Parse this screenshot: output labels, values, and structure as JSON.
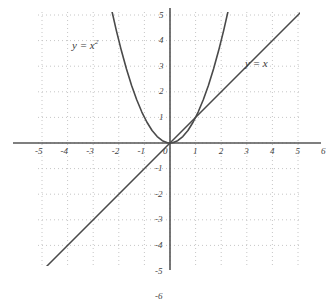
{
  "chart_data": {
    "type": "line",
    "title": "",
    "xlabel": "",
    "ylabel": "",
    "xlim": [
      -5.6,
      6.3
    ],
    "ylim": [
      -6.35,
      6.35
    ],
    "grid": true,
    "grid_style": "dotted",
    "grid_spacing": 1,
    "legend_position": "inline-annotations",
    "axes": {
      "x_axis_label_values": [
        "-5",
        "-4",
        "-3",
        "-2",
        "-1",
        "0",
        "1",
        "2",
        "3",
        "4",
        "5",
        "6"
      ],
      "y_axis_label_values": [
        "6",
        "5",
        "4",
        "3",
        "2",
        "1",
        "-1",
        "-2",
        "-3",
        "-4",
        "-5",
        "-6"
      ],
      "origin_label": "0"
    },
    "series": [
      {
        "name": "y = x²",
        "equation": "y = x^2",
        "label_text_main": "y = x",
        "label_exponent": "2",
        "color": "#4a4a4a",
        "x": [
          -2.46,
          -2.3,
          -2.1,
          -1.9,
          -1.7,
          -1.5,
          -1.3,
          -1.1,
          -0.9,
          -0.7,
          -0.5,
          -0.3,
          -0.1,
          0,
          0.1,
          0.3,
          0.5,
          0.7,
          0.9,
          1.1,
          1.3,
          1.5,
          1.7,
          1.9,
          2.1,
          2.3,
          2.46
        ],
        "y": [
          6.05,
          5.29,
          4.41,
          3.61,
          2.89,
          2.25,
          1.69,
          1.21,
          0.81,
          0.49,
          0.25,
          0.09,
          0.01,
          0,
          0.01,
          0.09,
          0.25,
          0.49,
          0.81,
          1.21,
          1.69,
          2.25,
          2.89,
          3.61,
          4.41,
          5.29,
          6.05
        ]
      },
      {
        "name": "y = x",
        "equation": "y = x",
        "label_text_main": "y = x",
        "label_exponent": "",
        "color": "#4a4a4a",
        "x": [
          -6.1,
          6.15
        ],
        "y": [
          -6.1,
          6.15
        ]
      }
    ],
    "annotations": [
      {
        "text": "y = x",
        "exponent": "2",
        "x": -3.3,
        "y": 4.3
      },
      {
        "text": "y = x",
        "exponent": "",
        "x": 3.3,
        "y": 3.5
      }
    ]
  },
  "colors": {
    "background": "#ffffff",
    "axis": "#555555",
    "grid_major": "#c9c9c9",
    "grid_minor": "#dcdcdc",
    "curve": "#4a4a4a",
    "text": "#3f3f3f"
  }
}
